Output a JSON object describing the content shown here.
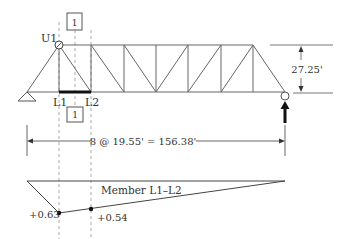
{
  "truss": {
    "nodes_label_top": "U1",
    "label_l1": "L1",
    "label_l2": "L2",
    "section_label_top": "1",
    "section_label_bottom": "1",
    "height_dim": "27.25'",
    "span_dim": "8 @ 19.55' = 156.38'",
    "panels": 8
  },
  "influence_line": {
    "title": "Member L1–L2",
    "value_l1": "+0.63",
    "value_l2": "+0.54"
  },
  "colors": {
    "line": "#555555",
    "dark": "#222222",
    "dashed": "#999999",
    "text": "#333333"
  }
}
